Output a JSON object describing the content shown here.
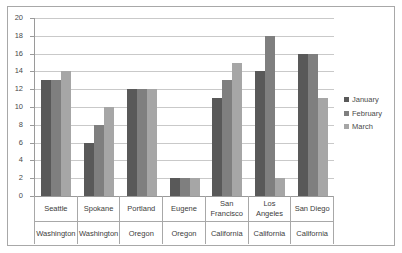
{
  "chart_data": {
    "type": "bar",
    "title": "",
    "subtitle": "",
    "xlabel": "",
    "ylabel": "",
    "ylim": [
      0,
      20
    ],
    "ytick_labels": [
      "0",
      "2",
      "4",
      "6",
      "8",
      "10",
      "12",
      "14",
      "16",
      "18",
      "20"
    ],
    "ytick_values": [
      0,
      2,
      4,
      6,
      8,
      10,
      12,
      14,
      16,
      18,
      20
    ],
    "grid": true,
    "legend_position": "right",
    "categories": [
      "Seattle",
      "Spokane",
      "Portland",
      "Eugene",
      "San Francisco",
      "Los Angeles",
      "San Diego"
    ],
    "group_subtitles": [
      "Washington",
      "Washington",
      "Oregon",
      "Oregon",
      "California",
      "California",
      "California"
    ],
    "series": [
      {
        "name": "January",
        "color": "#595959",
        "values": [
          13,
          6,
          12,
          2,
          11,
          14,
          16
        ]
      },
      {
        "name": "February",
        "color": "#7f7f7f",
        "values": [
          13,
          8,
          12,
          2,
          13,
          18,
          16
        ]
      },
      {
        "name": "March",
        "color": "#a6a6a6",
        "values": [
          14,
          10,
          12,
          2,
          15,
          2,
          11
        ]
      }
    ]
  },
  "legend": {
    "items": [
      {
        "label": "January",
        "color": "#595959"
      },
      {
        "label": "February",
        "color": "#7f7f7f"
      },
      {
        "label": "March",
        "color": "#a6a6a6"
      }
    ]
  },
  "colors": {
    "january": "#595959",
    "february": "#7f7f7f",
    "march": "#a6a6a6",
    "gridline": "#c9c9c9",
    "axis": "#9a9a9a",
    "frame_border": "#a8a8a8",
    "text": "#3c3c3c",
    "background": "#ffffff"
  }
}
